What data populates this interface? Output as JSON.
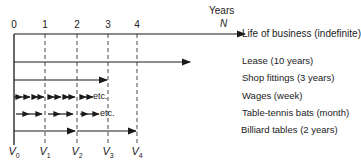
{
  "diagram": {
    "axis_title": "Years",
    "axis_end_label": "N",
    "ticks": [
      "0",
      "1",
      "2",
      "3",
      "4"
    ],
    "valuation_labels": [
      {
        "base": "V",
        "sub": "0"
      },
      {
        "base": "V",
        "sub": "1"
      },
      {
        "base": "V",
        "sub": "2"
      },
      {
        "base": "V",
        "sub": "3"
      },
      {
        "base": "V",
        "sub": "4"
      }
    ],
    "rows": [
      {
        "label": "Life of business (indefinite)"
      },
      {
        "label": "Lease (10 years)"
      },
      {
        "label": "Shop fittings (3 years)"
      },
      {
        "label": "Wages (week)",
        "suffix": "etc."
      },
      {
        "label": "Table-tennis bats (month)",
        "suffix": "etc."
      },
      {
        "label": "Billiard tables (2 years)"
      }
    ]
  }
}
